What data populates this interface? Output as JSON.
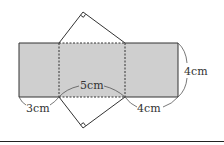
{
  "figure": {
    "type": "triangular-prism-net",
    "colors": {
      "face_fill": "#cfcfcf",
      "stroke": "#333333",
      "background": "#ffffff",
      "border": "#222222"
    },
    "faces": [
      {
        "name": "left-rectangle",
        "shape": "rectangle",
        "width_cm": 3,
        "height_cm": 4,
        "shaded": true
      },
      {
        "name": "middle-rectangle",
        "shape": "rectangle",
        "width_cm": 5,
        "height_cm": 4,
        "shaded": true
      },
      {
        "name": "right-rectangle",
        "shape": "rectangle",
        "width_cm": 4,
        "height_cm": 4,
        "shaded": true
      },
      {
        "name": "top-triangle",
        "shape": "right-triangle",
        "legs_cm": [
          3,
          4
        ],
        "hypotenuse_cm": 5,
        "right_angle_marked": true
      },
      {
        "name": "bottom-triangle",
        "shape": "right-triangle",
        "legs_cm": [
          3,
          4
        ],
        "hypotenuse_cm": 5,
        "right_angle_marked": true
      }
    ],
    "labels": {
      "left_width": "3cm",
      "middle_width": "5cm",
      "right_width": "4cm",
      "height": "4cm"
    }
  }
}
